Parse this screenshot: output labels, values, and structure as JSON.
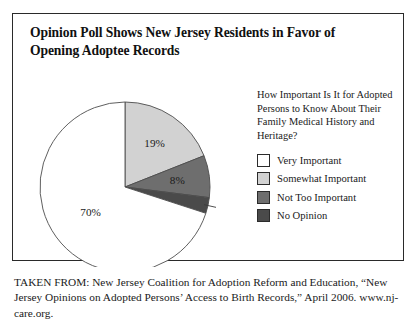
{
  "figure": {
    "title": "Opinion Poll Shows New Jersey Residents in Favor of Opening Adoptee Records",
    "source_note": "TAKEN FROM: New Jersey Coalition for Adoption Reform and Education, “New Jersey Opinions on Adopted Persons’ Access to Birth Records,” April 2006. www.nj-care.org."
  },
  "legend": {
    "question": "How Important Is It for Adopted Persons to Know About Their Family Medical History and Heritage?",
    "items": [
      {
        "label": "Very Important",
        "color": "#ffffff"
      },
      {
        "label": "Somewhat Important",
        "color": "#d2d2d2"
      },
      {
        "label": "Not Too Important",
        "color": "#6e6e6e"
      },
      {
        "label": "No Opinion",
        "color": "#4a4a4a"
      }
    ]
  },
  "chart_data": {
    "type": "pie",
    "title": "Opinion Poll Shows New Jersey Residents in Favor of Opening Adoptee Records",
    "legend_title": "How Important Is It for Adopted Persons to Know About Their Family Medical History and Heritage?",
    "legend_position": "right",
    "units": "percent",
    "start_angle_deg": 0,
    "direction": "clockwise",
    "categories": [
      "Very Important",
      "Somewhat Important",
      "Not Too Important",
      "No Opinion"
    ],
    "values": [
      70,
      19,
      8,
      3
    ],
    "labels": [
      "70%",
      "19%",
      "8%",
      "3%"
    ],
    "colors": [
      "#ffffff",
      "#d2d2d2",
      "#6e6e6e",
      "#4a4a4a"
    ],
    "slices": [
      {
        "category": "Very Important",
        "value": 70,
        "label": "70%",
        "color": "#ffffff",
        "label_placement": "inside"
      },
      {
        "category": "Somewhat Important",
        "value": 19,
        "label": "19%",
        "color": "#d2d2d2",
        "label_placement": "inside"
      },
      {
        "category": "Not Too Important",
        "value": 8,
        "label": "8%",
        "color": "#6e6e6e",
        "label_placement": "inside"
      },
      {
        "category": "No Opinion",
        "value": 3,
        "label": "3%",
        "color": "#4a4a4a",
        "label_placement": "outside-with-leader"
      }
    ]
  }
}
